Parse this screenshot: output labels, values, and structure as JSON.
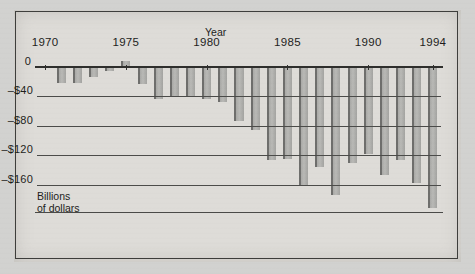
{
  "chart_data": {
    "type": "bar",
    "title": "",
    "xlabel": "Year",
    "ylabel": "Billions\nof dollars",
    "ylim": [
      -200,
      20
    ],
    "ytick_labels": [
      "0",
      "–$40",
      "–$80",
      "–$120",
      "–$160"
    ],
    "ytick_values": [
      0,
      -40,
      -80,
      -120,
      -160
    ],
    "xtick_labels": [
      "1970",
      "1975",
      "1980",
      "1985",
      "1990",
      "1994"
    ],
    "xtick_values": [
      1970,
      1975,
      1980,
      1985,
      1990,
      1994
    ],
    "grid": true,
    "legend": "none",
    "categories": [
      1970,
      1971,
      1972,
      1973,
      1974,
      1975,
      1976,
      1977,
      1978,
      1979,
      1980,
      1981,
      1982,
      1983,
      1984,
      1985,
      1986,
      1987,
      1988,
      1989,
      1990,
      1991,
      1992,
      1993,
      1994
    ],
    "values": [
      -2.8,
      -23,
      -23.4,
      -14.9,
      -6.1,
      7,
      -24,
      -45,
      -40,
      -41,
      -45,
      -48,
      -74,
      -86,
      -127,
      -125,
      -160,
      -136,
      -174,
      -131,
      -118,
      -146,
      -126,
      -157,
      -191
    ]
  },
  "axis": {
    "x_title": "Year",
    "y_unit": "Billions\nof dollars",
    "zero_label": "0"
  }
}
